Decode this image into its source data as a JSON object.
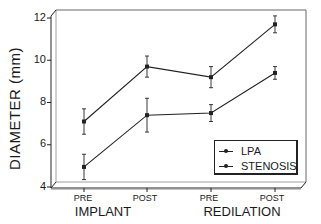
{
  "chart_data": {
    "type": "line",
    "title": "",
    "xlabel": "",
    "ylabel": "DIAMETER (mm)",
    "ylim": [
      4,
      12
    ],
    "yticks": [
      4,
      6,
      8,
      10,
      12
    ],
    "categories": [
      "PRE",
      "POST",
      "PRE",
      "POST"
    ],
    "category_groups": [
      {
        "label": "IMPLANT",
        "categories": [
          "PRE",
          "POST"
        ]
      },
      {
        "label": "REDILATION",
        "categories": [
          "PRE",
          "POST"
        ]
      }
    ],
    "series": [
      {
        "name": "LPA",
        "values": [
          7.1,
          9.7,
          9.2,
          11.7
        ],
        "error": [
          0.6,
          0.5,
          0.5,
          0.4
        ]
      },
      {
        "name": "STENOSIS",
        "values": [
          4.95,
          7.4,
          7.5,
          9.4
        ],
        "error": [
          0.6,
          0.8,
          0.4,
          0.3
        ]
      }
    ],
    "legend_position": "lower right",
    "grid": false
  },
  "axis": {
    "ylabel": "DIAMETER (mm)",
    "yticks": [
      "12",
      "10",
      "8",
      "6",
      "4"
    ],
    "xsub": [
      "PRE",
      "POST",
      "PRE",
      "POST"
    ],
    "xgroups": [
      "IMPLANT",
      "REDILATION"
    ]
  },
  "legend": {
    "items": [
      "LPA",
      "STENOSIS"
    ]
  }
}
